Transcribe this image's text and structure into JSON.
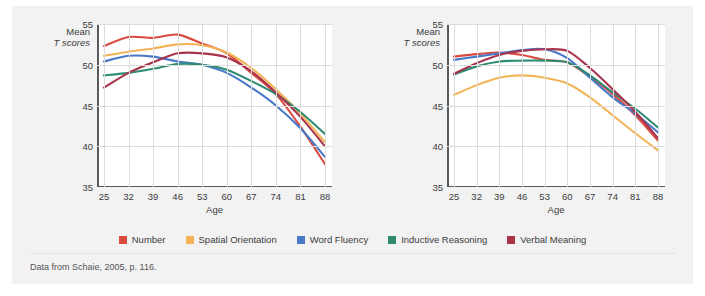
{
  "figure": {
    "source_note": "Data from Schaie, 2005, p. 116.",
    "y_axis_title_line1": "Mean",
    "y_axis_title_line2": "T scores",
    "x_axis_label": "Age"
  },
  "legend": {
    "items": [
      {
        "label": "Number",
        "color": "#d94a40"
      },
      {
        "label": "Spatial Orientation",
        "color": "#f2b457"
      },
      {
        "label": "Word Fluency",
        "color": "#4878c8"
      },
      {
        "label": "Inductive Reasoning",
        "color": "#2e8b74"
      },
      {
        "label": "Verbal Meaning",
        "color": "#a8324a"
      }
    ]
  },
  "chart_data": [
    {
      "type": "line",
      "title": "Men",
      "xlabel": "Age",
      "ylabel": "Mean T scores",
      "x": [
        25,
        32,
        39,
        46,
        53,
        60,
        67,
        74,
        81,
        88
      ],
      "xticks": [
        "25",
        "32",
        "39",
        "46",
        "53",
        "60",
        "67",
        "74",
        "81",
        "88"
      ],
      "yticks": [
        "35",
        "40",
        "45",
        "50",
        "55"
      ],
      "ylim": [
        35,
        55
      ],
      "grid": true,
      "legend_position": "bottom",
      "series": [
        {
          "name": "Number",
          "color": "#d94a40",
          "values": [
            52.3,
            53.4,
            53.3,
            53.7,
            52.6,
            51.4,
            49.0,
            46.4,
            42.4,
            37.8
          ]
        },
        {
          "name": "Spatial Orientation",
          "color": "#f2b457",
          "values": [
            51.1,
            51.6,
            52.0,
            52.5,
            52.4,
            51.5,
            49.6,
            47.0,
            44.0,
            40.5
          ]
        },
        {
          "name": "Word Fluency",
          "color": "#4878c8",
          "values": [
            50.4,
            51.1,
            51.0,
            50.4,
            50.0,
            49.0,
            47.2,
            45.0,
            42.2,
            38.7
          ]
        },
        {
          "name": "Inductive Reasoning",
          "color": "#2e8b74",
          "values": [
            48.7,
            49.0,
            49.5,
            50.1,
            50.0,
            49.4,
            48.0,
            46.4,
            44.2,
            41.5
          ]
        },
        {
          "name": "Verbal Meaning",
          "color": "#a8324a",
          "values": [
            47.2,
            49.0,
            50.3,
            51.4,
            51.4,
            50.9,
            49.2,
            46.6,
            43.6,
            40.0
          ]
        }
      ]
    },
    {
      "type": "line",
      "title": "Women",
      "xlabel": "Age",
      "ylabel": "Mean T scores",
      "x": [
        25,
        32,
        39,
        46,
        53,
        60,
        67,
        74,
        81,
        88
      ],
      "xticks": [
        "25",
        "32",
        "39",
        "46",
        "53",
        "60",
        "67",
        "74",
        "81",
        "88"
      ],
      "yticks": [
        "35",
        "40",
        "45",
        "50",
        "55"
      ],
      "ylim": [
        35,
        55
      ],
      "grid": true,
      "legend_position": "bottom",
      "series": [
        {
          "name": "Number",
          "color": "#d94a40",
          "values": [
            51.0,
            51.3,
            51.5,
            51.2,
            50.6,
            50.3,
            48.5,
            46.4,
            43.8,
            40.7
          ]
        },
        {
          "name": "Spatial Orientation",
          "color": "#f2b457",
          "values": [
            46.3,
            47.5,
            48.4,
            48.7,
            48.4,
            47.7,
            46.0,
            43.8,
            41.6,
            39.5
          ]
        },
        {
          "name": "Word Fluency",
          "color": "#4878c8",
          "values": [
            50.6,
            51.0,
            51.4,
            51.8,
            51.9,
            50.8,
            48.4,
            46.0,
            44.0,
            41.7
          ]
        },
        {
          "name": "Inductive Reasoning",
          "color": "#2e8b74",
          "values": [
            48.8,
            49.8,
            50.4,
            50.5,
            50.5,
            50.3,
            48.7,
            46.6,
            44.6,
            42.3
          ]
        },
        {
          "name": "Verbal Meaning",
          "color": "#a8324a",
          "values": [
            48.9,
            50.2,
            51.2,
            51.7,
            51.9,
            51.7,
            49.6,
            47.0,
            44.2,
            41.0
          ]
        }
      ]
    }
  ]
}
